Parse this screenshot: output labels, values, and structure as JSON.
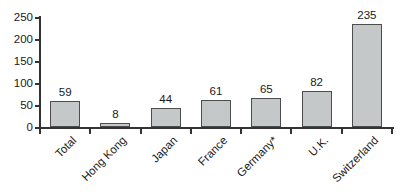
{
  "chart_data": {
    "type": "bar",
    "title": "",
    "xlabel": "",
    "ylabel": "",
    "categories": [
      "Total",
      "Hong Kong",
      "Japan",
      "France",
      "Germany*",
      "U.K.",
      "Switzerland"
    ],
    "values": [
      59,
      8,
      44,
      61,
      65,
      82,
      235
    ],
    "ylim": [
      0,
      250
    ],
    "yticks": [
      0,
      50,
      100,
      150,
      200,
      250
    ],
    "grid": false,
    "legend_position": "none",
    "data_labels_shown": true,
    "x_labels_rotation_deg": -45,
    "colors": {
      "bar_fill": "#c5c8c8",
      "bar_border": "#4d4d4d",
      "axis": "#333333",
      "text": "#1a1a1a",
      "background": "#ffffff"
    }
  }
}
